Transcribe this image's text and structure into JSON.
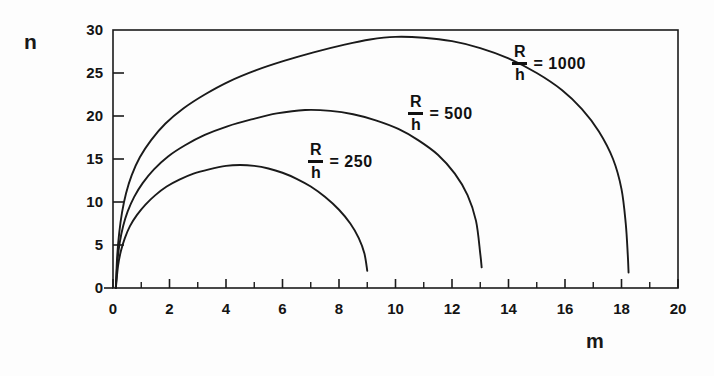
{
  "chart_data": {
    "type": "line",
    "title": "",
    "xlabel": "m",
    "ylabel": "n",
    "xlim": [
      0,
      20
    ],
    "ylim": [
      0,
      30
    ],
    "grid": false,
    "legend_position": "inline-annotations",
    "x_major_ticks": [
      0,
      2,
      4,
      6,
      8,
      10,
      12,
      14,
      16,
      18,
      20
    ],
    "x_minor_ticks": [
      1,
      3,
      5,
      7,
      9,
      11,
      13,
      15,
      17,
      19
    ],
    "x_tick_labels": [
      "0",
      "2",
      "4",
      "6",
      "8",
      "10",
      "12",
      "14",
      "16",
      "18",
      "20"
    ],
    "y_major_ticks": [
      0,
      5,
      10,
      15,
      20,
      25,
      30
    ],
    "y_tick_labels": [
      "0",
      "5",
      "10",
      "15",
      "20",
      "25",
      "30"
    ],
    "series": [
      {
        "name": "R/h = 250",
        "label_numerator": "R",
        "label_denominator": "h",
        "label_equals": "= 250",
        "color": "#1a1a1a",
        "peak": {
          "x": 4.5,
          "y": 14.3
        },
        "x_end": 9.0,
        "points": [
          [
            0.1,
            0.0
          ],
          [
            0.18,
            2.6
          ],
          [
            0.28,
            4.3
          ],
          [
            0.42,
            5.8
          ],
          [
            0.6,
            7.2
          ],
          [
            0.85,
            8.5
          ],
          [
            1.15,
            9.7
          ],
          [
            1.5,
            10.8
          ],
          [
            1.9,
            11.8
          ],
          [
            2.35,
            12.6
          ],
          [
            2.85,
            13.3
          ],
          [
            3.4,
            13.8
          ],
          [
            4.0,
            14.2
          ],
          [
            4.5,
            14.3
          ],
          [
            5.0,
            14.2
          ],
          [
            5.5,
            13.9
          ],
          [
            6.0,
            13.4
          ],
          [
            6.5,
            12.7
          ],
          [
            7.0,
            11.8
          ],
          [
            7.5,
            10.6
          ],
          [
            8.0,
            9.1
          ],
          [
            8.4,
            7.5
          ],
          [
            8.7,
            5.8
          ],
          [
            8.9,
            4.0
          ],
          [
            9.0,
            2.0
          ]
        ]
      },
      {
        "name": "R/h = 500",
        "label_numerator": "R",
        "label_denominator": "h",
        "label_equals": "= 500",
        "color": "#1a1a1a",
        "peak": {
          "x": 6.8,
          "y": 20.7
        },
        "x_end": 13.0,
        "points": [
          [
            0.1,
            0.0
          ],
          [
            0.16,
            3.2
          ],
          [
            0.24,
            5.3
          ],
          [
            0.36,
            7.2
          ],
          [
            0.52,
            8.9
          ],
          [
            0.75,
            10.6
          ],
          [
            1.05,
            12.2
          ],
          [
            1.45,
            13.8
          ],
          [
            1.95,
            15.3
          ],
          [
            2.55,
            16.6
          ],
          [
            3.25,
            17.8
          ],
          [
            4.05,
            18.8
          ],
          [
            4.9,
            19.6
          ],
          [
            5.8,
            20.3
          ],
          [
            6.8,
            20.7
          ],
          [
            7.7,
            20.6
          ],
          [
            8.5,
            20.2
          ],
          [
            9.3,
            19.5
          ],
          [
            10.1,
            18.5
          ],
          [
            10.8,
            17.2
          ],
          [
            11.5,
            15.5
          ],
          [
            12.1,
            13.3
          ],
          [
            12.55,
            10.8
          ],
          [
            12.85,
            7.8
          ],
          [
            13.0,
            4.0
          ],
          [
            13.05,
            2.4
          ]
        ]
      },
      {
        "name": "R/h = 1000",
        "label_numerator": "R",
        "label_denominator": "h",
        "label_equals": "= 1000",
        "color": "#1a1a1a",
        "peak": {
          "x": 10.0,
          "y": 29.2
        },
        "x_end": 18.2,
        "points": [
          [
            0.1,
            0.0
          ],
          [
            0.15,
            3.8
          ],
          [
            0.22,
            6.4
          ],
          [
            0.32,
            8.8
          ],
          [
            0.46,
            11.0
          ],
          [
            0.66,
            13.1
          ],
          [
            0.95,
            15.2
          ],
          [
            1.35,
            17.2
          ],
          [
            1.85,
            19.1
          ],
          [
            2.5,
            20.9
          ],
          [
            3.25,
            22.5
          ],
          [
            4.1,
            24.0
          ],
          [
            5.05,
            25.3
          ],
          [
            6.05,
            26.4
          ],
          [
            7.1,
            27.4
          ],
          [
            8.2,
            28.3
          ],
          [
            9.1,
            28.9
          ],
          [
            10.0,
            29.2
          ],
          [
            11.0,
            29.1
          ],
          [
            12.0,
            28.7
          ],
          [
            13.0,
            27.9
          ],
          [
            14.0,
            26.7
          ],
          [
            15.0,
            25.0
          ],
          [
            15.9,
            23.0
          ],
          [
            16.6,
            20.8
          ],
          [
            17.2,
            18.2
          ],
          [
            17.7,
            15.0
          ],
          [
            18.0,
            11.5
          ],
          [
            18.15,
            7.5
          ],
          [
            18.22,
            4.0
          ],
          [
            18.25,
            1.8
          ]
        ]
      }
    ]
  },
  "annotations": {
    "y_axis_title": "n",
    "x_axis_title": "m"
  }
}
